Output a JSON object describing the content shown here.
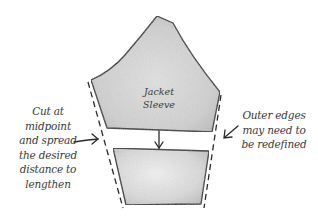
{
  "diagram": {
    "piece_label": [
      "Jacket",
      "Sleeve"
    ],
    "left_note": [
      "Cut at",
      "midpoint",
      "and spread",
      "the desired",
      "distance to",
      "lengthen"
    ],
    "right_note": [
      "Outer edges",
      "may need to",
      "be redefined"
    ],
    "colors": {
      "outline": "#2a2a2a",
      "fill": "#d4d4d4",
      "fill_light": "#ececec",
      "text": "#3a3a3a",
      "background": "#ffffff"
    },
    "pieces": [
      {
        "name": "sleeve-cap-piece",
        "points": "157,16 173,23 220,92 212,132 107,128 91,80"
      },
      {
        "name": "sleeve-lower-piece",
        "points": "113,148 209,151 201,204 126,205"
      }
    ],
    "dashed_lines": [
      {
        "name": "left-redefined-edge",
        "x1": 88,
        "y1": 82,
        "x2": 123,
        "y2": 208
      },
      {
        "name": "right-redefined-edge",
        "x1": 221,
        "y1": 95,
        "x2": 204,
        "y2": 208
      }
    ],
    "arrows": [
      {
        "name": "spread-arrow",
        "direction": "down"
      },
      {
        "name": "left-note-arrow",
        "direction": "right"
      },
      {
        "name": "right-note-arrow",
        "direction": "down-left"
      }
    ]
  }
}
